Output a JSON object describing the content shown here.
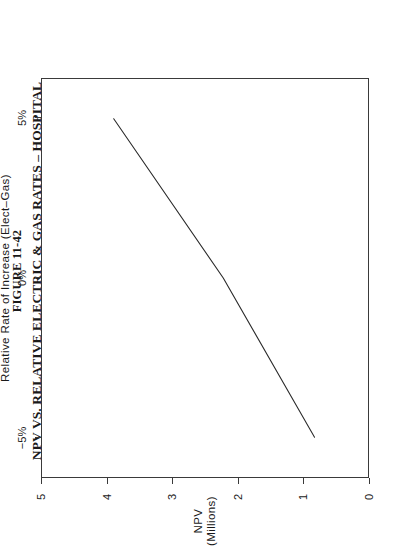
{
  "figure": {
    "number": "FIGURE 11-42",
    "title": "NPV VS. RELATIVE ELECTRIC & GAS RATES – HOSPITAL"
  },
  "axes": {
    "x_title": "Relative Rate of Increase  (Elect–Gas)",
    "y_title_line1": "NPV",
    "y_title_line2": "(Millions)"
  },
  "chart_data": {
    "type": "line",
    "title": "NPV VS. RELATIVE ELECTRIC & GAS RATES – HOSPITAL",
    "subtitle": "FIGURE 11-42",
    "xlabel": "Relative Rate of Increase  (Elect–Gas)",
    "ylabel": "NPV (Millions)",
    "xlim": [
      -6.25,
      6.25
    ],
    "ylim": [
      0,
      5
    ],
    "xticks": [
      -5,
      0,
      5
    ],
    "xticklabels": [
      "−5%",
      "0%",
      "5%"
    ],
    "yticks": [
      0,
      1,
      2,
      3,
      4,
      5
    ],
    "yticklabels": [
      "0",
      "1",
      "2",
      "3",
      "4",
      "5"
    ],
    "grid": false,
    "legend": null,
    "rotation_on_page_degrees": -90,
    "series": [
      {
        "name": "NPV",
        "x": [
          -5.0,
          0.0,
          5.0
        ],
        "y": [
          0.82,
          2.22,
          3.9
        ],
        "color": "#2a2a2a",
        "linewidth": 1
      }
    ]
  }
}
